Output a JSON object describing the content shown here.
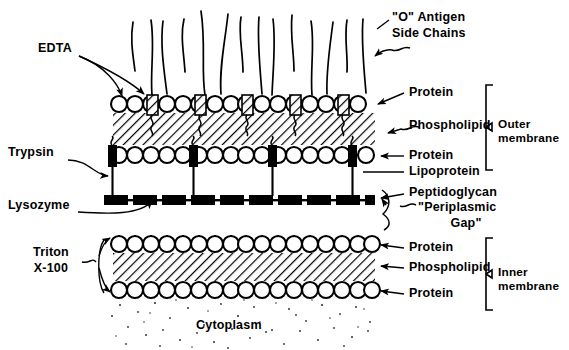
{
  "diagram": {
    "title_visible": false,
    "kind": "bacterial-cell-envelope-schematic"
  },
  "labels": {
    "edta": "EDTA",
    "trypsin": "Trypsin",
    "lysozyme": "Lysozyme",
    "triton_line1": "Triton",
    "triton_line2": "X-100",
    "o_antigen_line1": "\"O\" Antigen",
    "o_antigen_line2": "Side Chains",
    "protein_outer_top": "Protein",
    "phospholipid_outer": "Phospholipid",
    "protein_outer_bottom": "Protein",
    "lipoprotein": "Lipoprotein",
    "peptidoglycan": "Peptidoglycan",
    "periplasmic_line1": "\"Periplasmic",
    "periplasmic_line2": "Gap\"",
    "protein_inner_top": "Protein",
    "phospholipid_inner": "Phospholipid",
    "protein_inner_bottom": "Protein",
    "outer_membrane_line1": "Outer",
    "outer_membrane_line2": "membrane",
    "inner_membrane_line1": "Inner",
    "inner_membrane_line2": "membrane",
    "cytoplasm": "Cytoplasm"
  },
  "colors": {
    "ink": "#000000",
    "paper": "#ffffff",
    "hatch": "#1a1a1a",
    "stipple": "#2b2b2b"
  },
  "structure": {
    "layers": [
      "O antigen side chains",
      "Outer membrane outer leaflet (protein + phospholipid head groups)",
      "Outer membrane hatched phospholipid core",
      "Outer membrane inner leaflet (protein + lipoprotein)",
      "Peptidoglycan",
      "Periplasmic gap",
      "Inner membrane outer leaflet (protein)",
      "Inner membrane hatched phospholipid core",
      "Inner membrane inner leaflet (protein)",
      "Cytoplasm"
    ],
    "outer_membrane_head_count": 22,
    "inner_membrane_head_count": 22,
    "o_antigen_chain_count": 9,
    "lipoprotein_count": 4,
    "embedded_protein_count": 5
  }
}
